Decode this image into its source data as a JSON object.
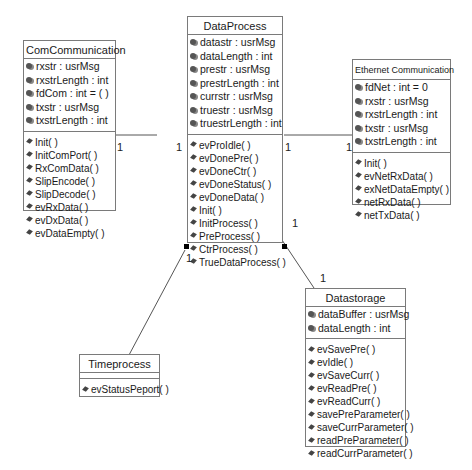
{
  "classes": {
    "com": {
      "name": "ComCommunication",
      "attributes": [
        "rxstr : usrMsg",
        "rxstrLength : int",
        "fdCom : int = ( )",
        "txstr : usrMsg",
        "txstrLength : int"
      ],
      "operations": [
        "Init( )",
        "InitComPort( )",
        "RxComData( )",
        "SlipEncode( )",
        "SlipDecode( )",
        "evRxData( )",
        "evDxData( )",
        "evDataEmpty( )"
      ]
    },
    "dp": {
      "name": "DataProcess",
      "attributes": [
        "datastr : usrMsg",
        "dataLength : int",
        "prestr : usrMsg",
        "prestrLength : int",
        "currstr : usrMsg",
        "truestr : usrMsg",
        "truestrLength : int"
      ],
      "operations": [
        "evProIdle( )",
        "evDonePre( )",
        "evDoneCtr( )",
        "evDoneStatus( )",
        "evDoneData( )",
        "Init( )",
        "InitProcess( )",
        "PreProcess( )",
        "CtrProcess( )",
        "TrueDataProcess( )"
      ]
    },
    "eth": {
      "name": "Ethernet Communication",
      "attributes": [
        "fdNet : int = 0",
        "rxstr : usrMsg",
        "rxstrLength : int",
        "txstr : usrMsg",
        "txstrLength : int"
      ],
      "operations": [
        "Init( )",
        "evNetRxData( )",
        "exNetDataEmpty( )",
        "netRxData( )",
        "netTxData( )"
      ]
    },
    "ds": {
      "name": "Datastorage",
      "attributes": [
        "dataBuffer : usrMsg",
        "dataLength : int"
      ],
      "operations": [
        "evSavePre( )",
        "evIdle( )",
        "evSaveCurr( )",
        "evReadPre( )",
        "evReadCurr( )",
        "savePreParameter( )",
        "saveCurrParameter( )",
        "readPreParameter( )",
        "readCurrParameter( )"
      ]
    },
    "tp": {
      "name": "Timeprocess",
      "attributes": [],
      "operations": [
        "evStatusPeport( )"
      ]
    }
  },
  "multiplicities": {
    "com_dp_left": "1",
    "com_dp_right": "1",
    "dp_eth_left": "1",
    "dp_eth_right": "1",
    "dp_tp": "1",
    "dp_ds_top": "1",
    "dp_ds_bottom": "1"
  },
  "colors": {
    "line": "#555555",
    "border": "#7a7a7a"
  }
}
